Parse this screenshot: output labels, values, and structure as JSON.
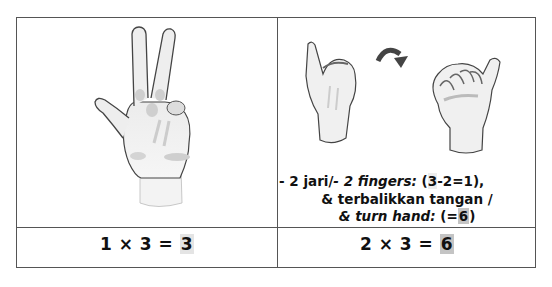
{
  "left_cell": {
    "image": "hand-showing-two-fingers-illustration",
    "equation": {
      "operand1": "1",
      "times": "×",
      "operand2": "3",
      "equals": "=",
      "result": "3"
    }
  },
  "right_cell": {
    "image_left": "hand-thumb-out-fist-back-illustration",
    "arrow": "curved-arrow-icon",
    "image_right": "hand-thumb-out-fist-palm-illustration",
    "description": {
      "line1_a": "- 2 jari/",
      "line1_b": "- 2 fingers:",
      "line1_c": " (",
      "line1_hl": "3",
      "line1_d": "-2=1),",
      "line2": "& terbalikkan tangan /",
      "line3_a": "& turn hand:",
      "line3_b": " (=",
      "line3_hl": "6",
      "line3_c": ")"
    },
    "equation": {
      "operand1": "2",
      "times": "×",
      "operand2": "3",
      "equals": "=",
      "result": "6"
    }
  },
  "colors": {
    "border": "#555555",
    "highlight_light": "#e4e4e4",
    "highlight_dark": "#c4c4c4"
  }
}
